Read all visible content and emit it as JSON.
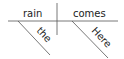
{
  "diagram": {
    "type": "sentence-diagram",
    "sentence": "Here comes the rain",
    "subject": "rain",
    "verb": "comes",
    "modifiers": [
      {
        "word": "the",
        "modifies": "rain"
      },
      {
        "word": "Here",
        "modifies": "comes"
      }
    ]
  },
  "colors": {
    "line": "#555555",
    "text": "#222222"
  }
}
